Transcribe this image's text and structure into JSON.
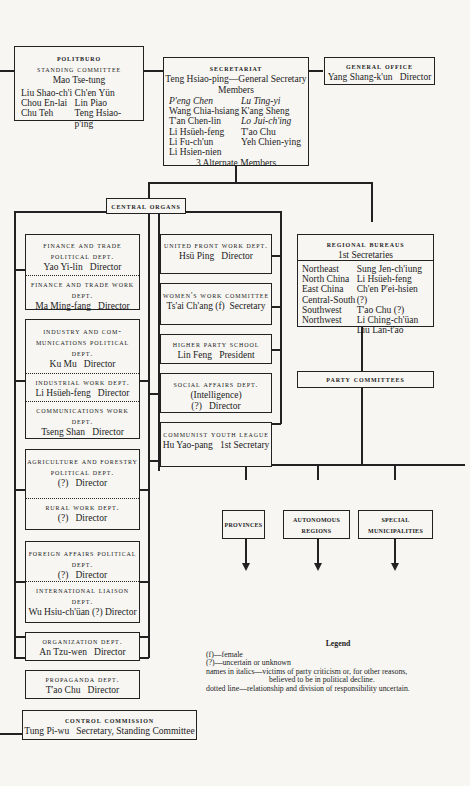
{
  "politburo": {
    "title": "POLITBURO",
    "subtitle": "STANDING COMMITTEE",
    "chairman": "Mao Tse-tung",
    "members_left": [
      "Liu Shao-ch'i",
      "Chou En-lai",
      "Chu Teh"
    ],
    "members_right": [
      "Ch'en Yün",
      "Lin Piao",
      "Teng Hsiao-p'ing"
    ]
  },
  "secretariat": {
    "title": "SECRETARIAT",
    "general_secretary": "Teng Hsiao-ping—General Secretary",
    "members_label": "Members",
    "members_left": [
      {
        "name": "P'eng Chen",
        "italic": true
      },
      {
        "name": "Wang Chia-hsiang",
        "italic": false
      },
      {
        "name": "T'an Chen-lin",
        "italic": false
      },
      {
        "name": "Li Hsüeh-feng",
        "italic": false
      },
      {
        "name": "Li Fu-ch'un",
        "italic": false
      },
      {
        "name": "Li Hsien-nien",
        "italic": false
      }
    ],
    "members_right": [
      {
        "name": "Lu Ting-yi",
        "italic": true
      },
      {
        "name": "K'ang Sheng",
        "italic": false
      },
      {
        "name": "Lo Jui-ch'ing",
        "italic": true
      },
      {
        "name": "T'ao Chu",
        "italic": false
      },
      {
        "name": "Yeh Chien-ying",
        "italic": false
      }
    ],
    "alternates": "3 Alternate Members"
  },
  "general_office": {
    "title": "GENERAL OFFICE",
    "head": "Yang Shang-k'un",
    "role": "Director"
  },
  "central_organs": {
    "label": "CENTRAL ORGANS",
    "left_column": [
      {
        "sections": [
          {
            "title": "FINANCE AND TRADE POLITICAL DEPT.",
            "head": "Yao Yi-lin",
            "role": "Director"
          },
          {
            "title": "FINANCE AND TRADE WORK DEPT.",
            "head": "Ma Ming-fang",
            "role": "Director"
          }
        ]
      },
      {
        "sections": [
          {
            "title": "INDUSTRY AND COM-MUNICATIONS POLITICAL DEPT.",
            "head": "Ku Mu",
            "role": "Director"
          },
          {
            "title": "INDUSTRIAL WORK DEPT.",
            "head": "Li Hsüeh-feng",
            "role": "Director"
          },
          {
            "title": "COMMUNICATIONS WORK DEPT.",
            "head": "Tseng Shan",
            "role": "Director"
          }
        ]
      },
      {
        "sections": [
          {
            "title": "AGRICULTURE AND FORESTRY POLITICAL DEPT.",
            "head": "(?)",
            "role": "Director"
          },
          {
            "title": "RURAL WORK DEPT.",
            "head": "(?)",
            "role": "Director"
          }
        ]
      },
      {
        "sections": [
          {
            "title": "FOREIGN AFFAIRS POLITICAL DEPT.",
            "head": "(?)",
            "role": "Director"
          },
          {
            "title": "INTERNATIONAL LIAISON DEPT.",
            "head": "Wu Hsiu-ch'üan (?)",
            "role": "Director"
          }
        ]
      },
      {
        "sections": [
          {
            "title": "ORGANIZATION DEPT.",
            "head": "An Tzu-wen",
            "role": "Director"
          }
        ]
      },
      {
        "sections": [
          {
            "title": "PROPAGANDA DEPT.",
            "head": "T'ao Chu",
            "role": "Director"
          }
        ]
      }
    ],
    "middle_column": [
      {
        "title": "UNITED FRONT WORK DEPT.",
        "extra": "",
        "head": "Hsü Ping",
        "role": "Director"
      },
      {
        "title": "WOMEN'S WORK COMMITTEE",
        "extra": "",
        "head": "Ts'ai Ch'ang (f)",
        "role": "Secretary"
      },
      {
        "title": "HIGHER PARTY SCHOOL",
        "extra": "",
        "head": "Lin Feng",
        "role": "President"
      },
      {
        "title": "SOCIAL AFFAIRS DEPT.",
        "extra": "(Intelligence)",
        "head": "(?)",
        "role": "Director"
      },
      {
        "title": "COMMUNIST YOUTH LEAGUE",
        "extra": "",
        "head": "Hu Yao-pang",
        "role": "1st Secretary"
      }
    ]
  },
  "regional_bureaus": {
    "title": "REGIONAL BUREAUS",
    "subtitle": "1st Secretaries",
    "rows": [
      {
        "region": "Northeast",
        "secretary": "Sung Jen-ch'iung"
      },
      {
        "region": "North China",
        "secretary": "Li Hsüeh-feng"
      },
      {
        "region": "East China",
        "secretary": "Ch'en P'ei-hsien (?)"
      },
      {
        "region": "Central-South",
        "secretary": "T'ao Chu (?)"
      },
      {
        "region": "Southwest",
        "secretary": "Li Ching-ch'üan"
      },
      {
        "region": "Northwest",
        "secretary": "Liu Lan-t'ao"
      }
    ]
  },
  "party_committees": {
    "title": "PARTY COMMITTEES",
    "children": [
      "PROVINCES",
      "AUTONOMOUS REGIONS",
      "SPECIAL MUNICIPALITIES"
    ]
  },
  "control_commission": {
    "title": "CONTROL COMMISSION",
    "head": "Tung Pi-wu",
    "role": "Secretary, Standing Committee"
  },
  "legend": {
    "title": "Legend",
    "items": [
      "(f)—female",
      "(?)—uncertain or unknown",
      "names in italics—victims of party criticism or, for other reasons,",
      "believed to be in political decline.",
      "dotted line—relationship and division of responsibility uncertain."
    ]
  }
}
